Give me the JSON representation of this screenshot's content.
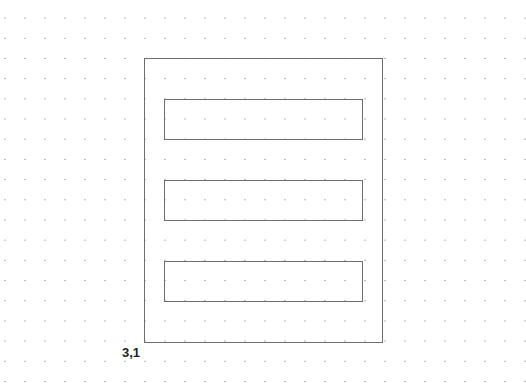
{
  "canvas": {
    "background": "#ffffff",
    "grid": {
      "type": "dots",
      "spacing_px": 20,
      "dot_color": "#b8b8b8"
    }
  },
  "shapes": {
    "outer": {
      "x": 144,
      "y": 58,
      "w": 239,
      "h": 285,
      "stroke": "#6e6e6e"
    },
    "bars": [
      {
        "x": 164,
        "y": 99,
        "w": 199,
        "h": 41
      },
      {
        "x": 164,
        "y": 180,
        "w": 199,
        "h": 41
      },
      {
        "x": 164,
        "y": 261,
        "w": 199,
        "h": 41
      }
    ]
  },
  "coordinate_label": "3,1"
}
